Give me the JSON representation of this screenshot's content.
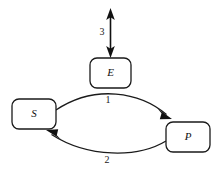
{
  "diagram": {
    "canvas": {
      "width": 221,
      "height": 172,
      "background": "#ffffff"
    },
    "stroke_color": "#1a1a1a",
    "fill_color": "#ffffff",
    "nodes": [
      {
        "id": "E",
        "label": "E",
        "name": "node-enzyme",
        "x": 90,
        "y": 58,
        "width": 41,
        "height": 30,
        "rx": 7,
        "cx": 110.5,
        "cy": 73
      },
      {
        "id": "S",
        "label": "S",
        "name": "node-substrate",
        "x": 12,
        "y": 99,
        "width": 44,
        "height": 30,
        "rx": 7,
        "cx": 34,
        "cy": 114
      },
      {
        "id": "P",
        "label": "P",
        "name": "node-product",
        "x": 166,
        "y": 122,
        "width": 44,
        "height": 30,
        "rx": 7,
        "cx": 188,
        "cy": 137
      }
    ],
    "edges": [
      {
        "id": "edge-1",
        "label": "1",
        "name": "edge-substrate-to-product",
        "from": "S",
        "to": "P",
        "arrow": "single",
        "label_x": 108,
        "label_y": 101
      },
      {
        "id": "edge-2",
        "label": "2",
        "name": "edge-product-to-substrate",
        "from": "P",
        "to": "S",
        "arrow": "single",
        "label_x": 107,
        "label_y": 161
      },
      {
        "id": "edge-3",
        "label": "3",
        "name": "edge-enzyme-exchange",
        "from": "E",
        "to": "external",
        "arrow": "double",
        "label_x": 102,
        "label_y": 33
      }
    ]
  }
}
